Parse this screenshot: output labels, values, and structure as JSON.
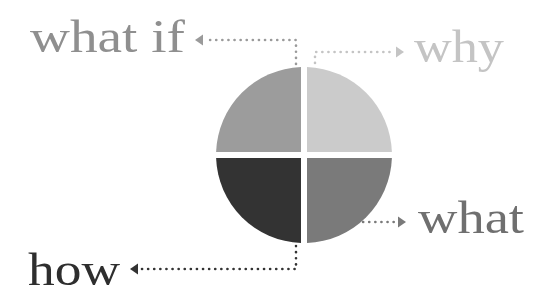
{
  "diagram": {
    "title": "",
    "type": "quadrant-circle",
    "center": {
      "x": 304,
      "y": 155
    },
    "radius": 88,
    "gap": 6,
    "quadrants": [
      {
        "id": "top-left",
        "label": "what if",
        "color": "#9c9c9c"
      },
      {
        "id": "top-right",
        "label": "why",
        "color": "#cbcbcb"
      },
      {
        "id": "bottom-right",
        "label": "what",
        "color": "#7a7a7a"
      },
      {
        "id": "bottom-left",
        "label": "how",
        "color": "#333333"
      }
    ],
    "labels": {
      "what_if": {
        "text": "what if",
        "color": "#8f8f8f"
      },
      "why": {
        "text": "why",
        "color": "#c4c4c4"
      },
      "what": {
        "text": "what",
        "color": "#6f6f6f"
      },
      "how": {
        "text": "how",
        "color": "#2e2e2e"
      }
    },
    "connector_colors": {
      "what_if": "#9a9a9a",
      "why": "#c4c4c4",
      "what": "#7a7a7a",
      "how": "#333333"
    }
  }
}
